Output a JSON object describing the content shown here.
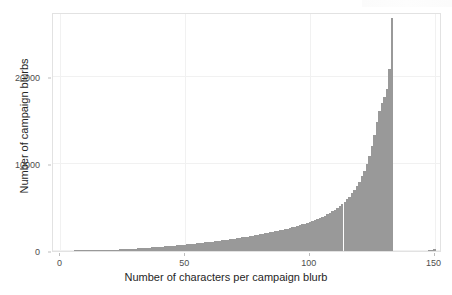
{
  "chart_data": {
    "type": "bar",
    "title": "",
    "subtitle": "",
    "xlabel": "Number of characters per campaign blurb",
    "ylabel": "Number of campaign blurbs",
    "xlim": [
      -3,
      153
    ],
    "ylim": [
      0,
      27500
    ],
    "xticks": [
      0,
      50,
      100,
      150
    ],
    "xticklabels": [
      "0",
      "50",
      "100",
      "150"
    ],
    "yticks": [
      0,
      10000,
      20000
    ],
    "yticklabels": [
      "0",
      "10000",
      "20000"
    ],
    "grid": true,
    "legend": null,
    "bar_color": "#999999",
    "panel_background": "#ffffff",
    "gridline_color": "#f1f1f1",
    "bin_width": 1,
    "categories": [
      0,
      1,
      2,
      3,
      4,
      5,
      6,
      7,
      8,
      9,
      10,
      11,
      12,
      13,
      14,
      15,
      16,
      17,
      18,
      19,
      20,
      21,
      22,
      23,
      24,
      25,
      26,
      27,
      28,
      29,
      30,
      31,
      32,
      33,
      34,
      35,
      36,
      37,
      38,
      39,
      40,
      41,
      42,
      43,
      44,
      45,
      46,
      47,
      48,
      49,
      50,
      51,
      52,
      53,
      54,
      55,
      56,
      57,
      58,
      59,
      60,
      61,
      62,
      63,
      64,
      65,
      66,
      67,
      68,
      69,
      70,
      71,
      72,
      73,
      74,
      75,
      76,
      77,
      78,
      79,
      80,
      81,
      82,
      83,
      84,
      85,
      86,
      87,
      88,
      89,
      90,
      91,
      92,
      93,
      94,
      95,
      96,
      97,
      98,
      99,
      100,
      101,
      102,
      103,
      104,
      105,
      106,
      107,
      108,
      109,
      110,
      111,
      112,
      113,
      114,
      115,
      116,
      117,
      118,
      119,
      120,
      121,
      122,
      123,
      124,
      125,
      126,
      127,
      128,
      129,
      130,
      131,
      132,
      133,
      134,
      135,
      136,
      137,
      138,
      139,
      140,
      141,
      142,
      143,
      144,
      145,
      146,
      147,
      148,
      149,
      150
    ],
    "values": [
      0,
      0,
      0,
      0,
      0,
      0,
      5,
      10,
      15,
      20,
      25,
      30,
      40,
      50,
      60,
      70,
      80,
      90,
      100,
      110,
      120,
      135,
      150,
      165,
      180,
      195,
      210,
      225,
      240,
      255,
      270,
      290,
      310,
      330,
      350,
      370,
      390,
      410,
      430,
      450,
      470,
      495,
      520,
      545,
      570,
      595,
      620,
      645,
      670,
      700,
      730,
      760,
      790,
      820,
      850,
      880,
      910,
      945,
      980,
      1015,
      1050,
      1085,
      1120,
      1160,
      1200,
      1240,
      1280,
      1320,
      1360,
      1400,
      1440,
      1485,
      1530,
      1575,
      1620,
      1665,
      1715,
      1765,
      1815,
      1865,
      1915,
      1970,
      2025,
      2080,
      2140,
      2200,
      2260,
      2320,
      2385,
      2450,
      2520,
      2590,
      2660,
      2735,
      2810,
      2890,
      2975,
      3060,
      3150,
      3245,
      3345,
      3450,
      3560,
      3675,
      3800,
      3930,
      4070,
      4220,
      4380,
      4550,
      4730,
      4930,
      5150,
      5390,
      5650,
      5940,
      6260,
      6620,
      7020,
      7470,
      7990,
      8580,
      9260,
      10050,
      10970,
      12050,
      13320,
      14820,
      16150,
      17050,
      17700,
      18600,
      21000,
      26800,
      0,
      0,
      0,
      0,
      0,
      0,
      0,
      0,
      0,
      0,
      0,
      0,
      0,
      0,
      60,
      120,
      260
    ]
  },
  "axes": {
    "y_title": "Number of campaign blurbs",
    "x_title": "Number of characters per campaign blurb"
  }
}
